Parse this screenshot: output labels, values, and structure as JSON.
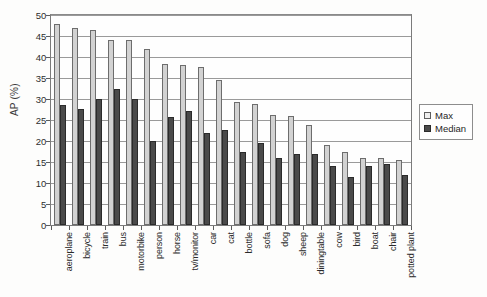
{
  "chart_data": {
    "type": "bar",
    "title": "",
    "xlabel": "",
    "ylabel": "AP (%)",
    "ylim": [
      0,
      50
    ],
    "ytick_step": 5,
    "yticks": [
      "50",
      "45",
      "40",
      "35",
      "30",
      "25",
      "20",
      "15",
      "10",
      "5",
      "0"
    ],
    "grid": true,
    "grid_axis": "y",
    "legend_position": "right",
    "categories": [
      "aeroplane",
      "bicycle",
      "train",
      "bus",
      "motorbike",
      "person",
      "horse",
      "tv/monitor",
      "car",
      "cat",
      "bottle",
      "sofa",
      "dog",
      "sheep",
      "diningtable",
      "cow",
      "bird",
      "boat",
      "chair",
      "potted plant"
    ],
    "series": [
      {
        "name": "Max",
        "color": "#d2d2d2",
        "values": [
          47.8,
          47.0,
          46.5,
          44.0,
          44.0,
          41.8,
          38.4,
          38.0,
          37.6,
          34.5,
          29.3,
          28.7,
          26.3,
          26.0,
          23.8,
          19.0,
          17.3,
          16.0,
          16.0,
          15.5
        ]
      },
      {
        "name": "Median",
        "color": "#4a4a4a",
        "values": [
          28.5,
          27.7,
          30.0,
          32.3,
          30.0,
          20.0,
          25.6,
          27.2,
          21.8,
          22.6,
          17.5,
          19.5,
          16.0,
          17.0,
          16.8,
          14.0,
          11.5,
          14.0,
          14.5,
          12.0
        ]
      }
    ]
  },
  "legend": {
    "entries": [
      {
        "label": "Max",
        "swatch": "max-swatch"
      },
      {
        "label": "Median",
        "swatch": "median-swatch"
      }
    ]
  },
  "axes": {
    "y_title": "AP (%)"
  }
}
